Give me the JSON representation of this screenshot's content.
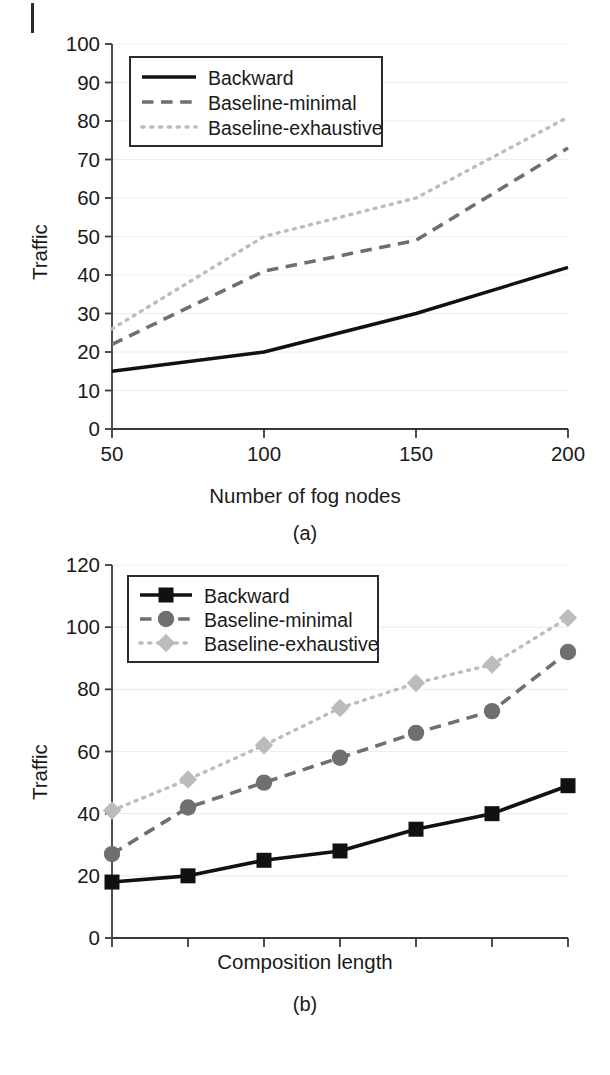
{
  "page": {
    "background": "#ffffff",
    "artifact_margin_bar": true
  },
  "colors": {
    "backward": "#111111",
    "baseline_minimal": "#6f6f6f",
    "baseline_exhaustive": "#bcbcbc",
    "axis": "#3a3a3a",
    "grid": "#ededed",
    "text": "#1a1a1a",
    "legend_border": "#2b2b2b"
  },
  "figures": [
    {
      "id": "a",
      "caption": "(a)",
      "ylabel": "Traffic",
      "xlabel": "Number of fog nodes"
    },
    {
      "id": "b",
      "caption": "(b)",
      "ylabel": "Traffic",
      "xlabel": "Composition length"
    }
  ],
  "chart_data": [
    {
      "type": "line",
      "panel": "(a)",
      "title": "",
      "xlabel": "Number of fog nodes",
      "ylabel": "Traffic",
      "x": [
        50,
        100,
        150,
        200
      ],
      "xticklabels": [
        "50",
        "100",
        "150",
        "200"
      ],
      "xlim": [
        50,
        200
      ],
      "ylim": [
        0,
        100
      ],
      "yticks": [
        0,
        10,
        20,
        30,
        40,
        50,
        60,
        70,
        80,
        90,
        100
      ],
      "yticklabels": [
        "0",
        "10",
        "20",
        "30",
        "40",
        "50",
        "60",
        "70",
        "80",
        "90",
        "100"
      ],
      "grid": true,
      "grid_axis": "y",
      "legend_position": "upper left",
      "markers": false,
      "series": [
        {
          "name": "Backward",
          "linestyle": "solid",
          "color": "#111111",
          "values": [
            15,
            20,
            30,
            42
          ]
        },
        {
          "name": "Baseline-minimal",
          "linestyle": "dashed",
          "color": "#6f6f6f",
          "values": [
            22,
            41,
            49,
            73
          ]
        },
        {
          "name": "Baseline-exhaustive",
          "linestyle": "dotted",
          "color": "#bcbcbc",
          "values": [
            26,
            50,
            60,
            81
          ]
        }
      ]
    },
    {
      "type": "line",
      "panel": "(b)",
      "title": "",
      "xlabel": "Composition length",
      "ylabel": "Traffic",
      "x": [
        4,
        5,
        6,
        7,
        8,
        9,
        10
      ],
      "xticklabels": [
        "4",
        "5",
        "6",
        "7",
        "8",
        "9",
        "10"
      ],
      "xlim": [
        4,
        10
      ],
      "ylim": [
        0,
        120
      ],
      "yticks": [
        0,
        20,
        40,
        60,
        80,
        100,
        120
      ],
      "yticklabels": [
        "0",
        "20",
        "40",
        "60",
        "80",
        "100",
        "120"
      ],
      "grid": true,
      "grid_axis": "y",
      "legend_position": "upper left",
      "markers": true,
      "series": [
        {
          "name": "Backward",
          "linestyle": "solid",
          "marker": "square",
          "color": "#111111",
          "values": [
            18,
            20,
            25,
            28,
            35,
            40,
            49
          ]
        },
        {
          "name": "Baseline-minimal",
          "linestyle": "dashed",
          "marker": "circle",
          "color": "#6f6f6f",
          "values": [
            27,
            42,
            50,
            58,
            66,
            73,
            92
          ]
        },
        {
          "name": "Baseline-exhaustive",
          "linestyle": "dotted",
          "marker": "diamond",
          "color": "#bcbcbc",
          "values": [
            41,
            51,
            62,
            74,
            82,
            88,
            103
          ]
        }
      ]
    }
  ]
}
